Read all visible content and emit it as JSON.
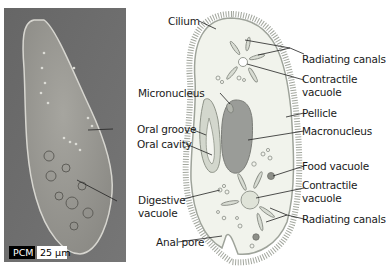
{
  "figure": {
    "photo": {
      "mode_badge": "PCM",
      "scale_bar": "25 µm"
    },
    "labels": {
      "cilium": "Cilium",
      "radiating_canals_top": "Radiating canals",
      "contractile_vacuole_top_1": "Contractile",
      "contractile_vacuole_top_2": "vacuole",
      "micronucleus": "Micronucleus",
      "pellicle": "Pellicle",
      "oral_groove": "Oral groove",
      "macronucleus": "Macronucleus",
      "oral_cavity": "Oral cavity",
      "food_vacuole": "Food vacuole",
      "contractile_vacuole_bottom_1": "Contractile",
      "contractile_vacuole_bottom_2": "vacuole",
      "digestive_vacuole_1": "Digestive",
      "digestive_vacuole_2": "vacuole",
      "radiating_canals_bottom": "Radiating canals",
      "anal_pore": "Anal pore"
    },
    "colors": {
      "photo_bg": "#6e6e6e",
      "cell_body": "#f1f3ec",
      "cell_outline": "#9ea39a",
      "macronucleus": "#9a9c98",
      "vacuole_fill": "#d8dcd3",
      "food_vacuole": "#8d8f88"
    }
  }
}
